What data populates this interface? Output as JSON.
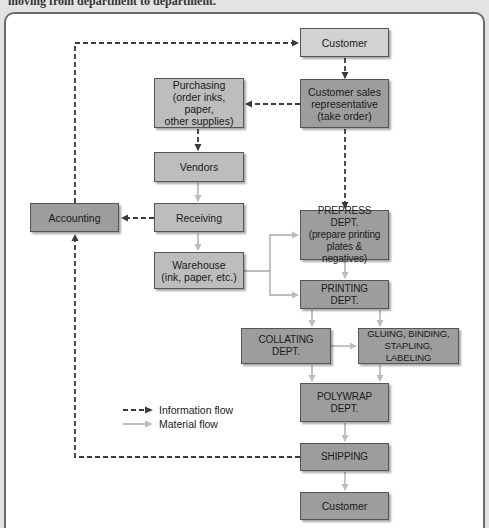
{
  "caption": "moving from department to department.",
  "colors": {
    "information_flow": "#3a3a3a",
    "material_flow": "#bdbdbd",
    "box_light": "#d2d2d2",
    "box_mid": "#bdbdbd",
    "box_dark": "#9d9d9d"
  },
  "nodes": {
    "customer_top": "Customer",
    "csr_line1": "Customer sales",
    "csr_line2": "representative",
    "csr_line3": "(take order)",
    "purchasing_line1": "Purchasing",
    "purchasing_line2": "(order inks, paper,",
    "purchasing_line3": "other supplies)",
    "vendors": "Vendors",
    "accounting": "Accounting",
    "receiving": "Receiving",
    "warehouse_line1": "Warehouse",
    "warehouse_line2": "(ink, paper, etc.)",
    "prepress_line1": "PREPRESS DEPT.",
    "prepress_line2": "(prepare printing",
    "prepress_line3": "plates & negatives)",
    "printing_line1": "PRINTING",
    "printing_line2": "DEPT.",
    "collating_line1": "COLLATING",
    "collating_line2": "DEPT.",
    "gluing_line1": "GLUING, BINDING,",
    "gluing_line2": "STAPLING, LABELING",
    "polywrap_line1": "POLYWRAP",
    "polywrap_line2": "DEPT.",
    "shipping": "SHIPPING",
    "customer_bottom": "Customer"
  },
  "edges": {
    "information_flow": [
      [
        "Accounting",
        "Customer (top)"
      ],
      [
        "Customer (top)",
        "Customer sales representative"
      ],
      [
        "Customer sales representative",
        "Purchasing"
      ],
      [
        "Customer sales representative",
        "PREPRESS DEPT."
      ],
      [
        "Purchasing",
        "Vendors"
      ],
      [
        "Receiving",
        "Accounting"
      ],
      [
        "SHIPPING",
        "Accounting"
      ]
    ],
    "material_flow": [
      [
        "Vendors",
        "Receiving"
      ],
      [
        "Receiving",
        "Warehouse"
      ],
      [
        "Warehouse",
        "PREPRESS DEPT."
      ],
      [
        "Warehouse",
        "PRINTING DEPT."
      ],
      [
        "PREPRESS DEPT.",
        "PRINTING DEPT."
      ],
      [
        "PRINTING DEPT.",
        "COLLATING DEPT."
      ],
      [
        "PRINTING DEPT.",
        "GLUING, BINDING, STAPLING, LABELING"
      ],
      [
        "COLLATING DEPT.",
        "GLUING, BINDING, STAPLING, LABELING"
      ],
      [
        "COLLATING DEPT.",
        "POLYWRAP DEPT."
      ],
      [
        "GLUING, BINDING, STAPLING, LABELING",
        "POLYWRAP DEPT."
      ],
      [
        "POLYWRAP DEPT.",
        "SHIPPING"
      ],
      [
        "SHIPPING",
        "Customer (bottom)"
      ]
    ]
  },
  "legend": {
    "information_flow": "Information flow",
    "material_flow": "Material flow"
  }
}
